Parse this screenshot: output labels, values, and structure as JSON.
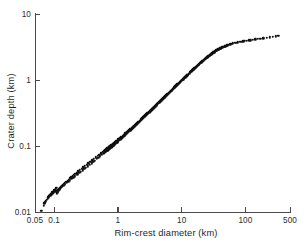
{
  "chart_data": {
    "type": "scatter",
    "title": "",
    "xlabel": "Rim-crest diameter (km)",
    "ylabel": "Crater depth (km)",
    "xscale": "log",
    "yscale": "log",
    "xlim": [
      0.05,
      500
    ],
    "ylim": [
      0.01,
      10
    ],
    "xticks": [
      0.05,
      0.1,
      1,
      10,
      100,
      500
    ],
    "xticklabels": [
      "0.05",
      "0.1",
      "1",
      "10",
      "100",
      "500"
    ],
    "yticks": [
      0.01,
      0.1,
      1,
      10
    ],
    "yticklabels": [
      "0.01",
      "0.1",
      "1",
      "10"
    ],
    "grid": false,
    "legend": null,
    "marker": "filled-circle",
    "marker_color": "#111111",
    "series": [
      {
        "name": "craters",
        "x": [
          0.063,
          0.068,
          0.07,
          0.072,
          0.074,
          0.076,
          0.079,
          0.081,
          0.083,
          0.085,
          0.087,
          0.089,
          0.09,
          0.092,
          0.094,
          0.096,
          0.098,
          0.1,
          0.101,
          0.103,
          0.105,
          0.107,
          0.109,
          0.11,
          0.112,
          0.115,
          0.118,
          0.12,
          0.123,
          0.126,
          0.13,
          0.134,
          0.138,
          0.143,
          0.148,
          0.155,
          0.162,
          0.17,
          0.178,
          0.186,
          0.195,
          0.205,
          0.215,
          0.228,
          0.24,
          0.255,
          0.27,
          0.288,
          0.305,
          0.325,
          0.345,
          0.37,
          0.395,
          0.42,
          0.45,
          0.48,
          0.51,
          0.545,
          0.58,
          0.61,
          0.625,
          0.64,
          0.655,
          0.665,
          0.675,
          0.685,
          0.695,
          0.705,
          0.715,
          0.725,
          0.735,
          0.745,
          0.76,
          0.775,
          0.79,
          0.81,
          0.83,
          0.85,
          0.875,
          0.9,
          0.93,
          0.96,
          0.99,
          1.02,
          1.05,
          1.08,
          1.12,
          1.15,
          1.19,
          1.23,
          1.27,
          1.31,
          1.36,
          1.4,
          1.45,
          1.5,
          1.55,
          1.6,
          1.66,
          1.72,
          1.78,
          1.84,
          1.9,
          1.97,
          2.04,
          2.11,
          2.18,
          2.26,
          2.34,
          2.42,
          2.5,
          2.59,
          2.68,
          2.77,
          2.87,
          2.97,
          3.07,
          3.18,
          3.29,
          3.4,
          3.52,
          3.64,
          3.77,
          3.9,
          4.03,
          4.17,
          4.32,
          4.47,
          4.62,
          4.78,
          4.95,
          5.12,
          5.3,
          5.48,
          5.67,
          5.87,
          6.07,
          6.28,
          6.5,
          6.72,
          6.95,
          7.19,
          7.44,
          7.7,
          7.96,
          8.24,
          8.52,
          8.82,
          9.12,
          9.44,
          9.76,
          10.1,
          10.4,
          10.8,
          11.2,
          11.6,
          12.0,
          12.4,
          12.8,
          13.3,
          13.7,
          14.2,
          14.7,
          15.2,
          15.8,
          16.3,
          16.9,
          17.5,
          18.1,
          18.7,
          19.4,
          20.1,
          20.8,
          21.5,
          22.3,
          23.1,
          23.9,
          24.7,
          25.6,
          26.5,
          27.4,
          28.4,
          29.4,
          30.4,
          31.5,
          32.6,
          33.7,
          34.9,
          36.1,
          37.4,
          38.7,
          40.1,
          41.5,
          43.0,
          44.5,
          46.1,
          47.7,
          49.4,
          51.1,
          52.9,
          55.0,
          58.0,
          61.0,
          64.0,
          68.0,
          72.0,
          76.0,
          81.0,
          86.0,
          92.0,
          98.0,
          105.0,
          112.0,
          120.0,
          130.0,
          142.0,
          155.0,
          170.0,
          190.0,
          215.0,
          240.0,
          270.0,
          300.0,
          330.0,
          0.082,
          0.086,
          0.091,
          0.095,
          0.099,
          0.104,
          0.108,
          0.113,
          0.117,
          0.122,
          0.128,
          0.133,
          0.14,
          0.147,
          0.158,
          0.166,
          0.176,
          0.19,
          0.2,
          0.212,
          0.232,
          0.248,
          0.262,
          0.28,
          0.298,
          0.315,
          0.335,
          0.36,
          0.385,
          0.41,
          0.435,
          0.465,
          0.495,
          0.525,
          0.56,
          0.595,
          0.618,
          0.632,
          0.648,
          0.66,
          0.67,
          0.68,
          0.69,
          0.7,
          0.71,
          0.72,
          0.73,
          0.74,
          0.752,
          0.768,
          0.782,
          0.8,
          0.82,
          0.84,
          0.862,
          0.888,
          0.915,
          0.945,
          0.975,
          1.0,
          1.04,
          1.07,
          1.1,
          1.14,
          1.17,
          1.21,
          1.25,
          1.29,
          1.33,
          1.38,
          1.43,
          1.48,
          1.53,
          1.58,
          1.63,
          1.69,
          1.75,
          1.81,
          1.87,
          1.94,
          2.0,
          2.07,
          2.14,
          2.22,
          2.3,
          2.38,
          2.46,
          2.55,
          2.63,
          2.72,
          2.82,
          2.92,
          3.02,
          3.13,
          3.24,
          3.35,
          3.46,
          3.58,
          3.71,
          3.84,
          3.97,
          4.1,
          4.25,
          4.4,
          4.55,
          4.7,
          4.87,
          5.04,
          5.21,
          5.39,
          5.58,
          5.77,
          5.97,
          6.18,
          6.39,
          6.61,
          6.84,
          7.07,
          7.32,
          7.57,
          7.83,
          8.1,
          8.38,
          8.67,
          8.97,
          9.28,
          9.6,
          9.93,
          10.3,
          10.6,
          11.0,
          11.4,
          11.8,
          12.2,
          12.6,
          13.1,
          13.5,
          14.0,
          14.5,
          15.0,
          15.5,
          16.1,
          16.6,
          17.2,
          17.8,
          18.4,
          19.1,
          19.8,
          20.5,
          21.2,
          22.0,
          22.8,
          23.6,
          24.4,
          25.3,
          26.2,
          27.1,
          28.1,
          29.1,
          30.1,
          31.2,
          32.3,
          33.4,
          34.6,
          35.8,
          37.1,
          38.4,
          39.8,
          41.2,
          42.6,
          44.1,
          45.7,
          47.3,
          49.0,
          50.7,
          52.5
        ],
        "y": [
          0.0105,
          0.0125,
          0.0135,
          0.014,
          0.0145,
          0.0152,
          0.016,
          0.0168,
          0.0175,
          0.0182,
          0.0176,
          0.0182,
          0.0188,
          0.0194,
          0.02,
          0.0196,
          0.0202,
          0.0208,
          0.0212,
          0.0218,
          0.0223,
          0.0228,
          0.0232,
          0.019,
          0.0196,
          0.0205,
          0.0212,
          0.0218,
          0.0224,
          0.0231,
          0.024,
          0.0248,
          0.0256,
          0.0265,
          0.0274,
          0.0285,
          0.0297,
          0.031,
          0.0322,
          0.0335,
          0.0348,
          0.0363,
          0.0378,
          0.0396,
          0.0412,
          0.0432,
          0.0452,
          0.0475,
          0.0498,
          0.0522,
          0.0548,
          0.0578,
          0.0608,
          0.0638,
          0.0672,
          0.0706,
          0.074,
          0.0778,
          0.0816,
          0.0848,
          0.0865,
          0.088,
          0.0896,
          0.0905,
          0.0915,
          0.0925,
          0.0935,
          0.0945,
          0.0955,
          0.0965,
          0.0975,
          0.0985,
          0.1,
          0.1015,
          0.103,
          0.105,
          0.107,
          0.109,
          0.1115,
          0.114,
          0.117,
          0.12,
          0.123,
          0.126,
          0.129,
          0.132,
          0.136,
          0.139,
          0.143,
          0.147,
          0.151,
          0.155,
          0.16,
          0.164,
          0.169,
          0.174,
          0.179,
          0.184,
          0.19,
          0.196,
          0.202,
          0.208,
          0.214,
          0.221,
          0.228,
          0.235,
          0.242,
          0.25,
          0.258,
          0.266,
          0.274,
          0.283,
          0.292,
          0.301,
          0.311,
          0.321,
          0.331,
          0.342,
          0.353,
          0.364,
          0.376,
          0.388,
          0.4,
          0.413,
          0.426,
          0.44,
          0.454,
          0.469,
          0.484,
          0.499,
          0.516,
          0.532,
          0.549,
          0.567,
          0.585,
          0.604,
          0.623,
          0.643,
          0.664,
          0.685,
          0.707,
          0.73,
          0.754,
          0.778,
          0.803,
          0.829,
          0.856,
          0.883,
          0.912,
          0.941,
          0.971,
          1.0,
          1.03,
          1.06,
          1.1,
          1.13,
          1.17,
          1.21,
          1.24,
          1.28,
          1.32,
          1.36,
          1.41,
          1.45,
          1.5,
          1.54,
          1.59,
          1.64,
          1.69,
          1.74,
          1.79,
          1.85,
          1.9,
          1.96,
          2.02,
          2.08,
          2.14,
          2.2,
          2.26,
          2.32,
          2.38,
          2.44,
          2.5,
          2.56,
          2.62,
          2.68,
          2.74,
          2.8,
          2.86,
          2.92,
          2.97,
          3.02,
          3.07,
          3.12,
          3.17,
          3.21,
          3.26,
          3.3,
          3.34,
          3.38,
          3.42,
          3.48,
          3.53,
          3.58,
          3.63,
          3.68,
          3.72,
          3.77,
          3.81,
          3.85,
          3.89,
          3.94,
          3.98,
          4.02,
          4.07,
          4.12,
          4.17,
          4.22,
          4.28,
          4.35,
          4.42,
          4.5,
          4.58,
          4.66,
          0.0172,
          0.0178,
          0.0184,
          0.019,
          0.0196,
          0.0204,
          0.021,
          0.0216,
          0.0222,
          0.0228,
          0.0236,
          0.0244,
          0.0252,
          0.0262,
          0.0276,
          0.0288,
          0.03,
          0.0318,
          0.033,
          0.0346,
          0.0372,
          0.039,
          0.0408,
          0.0428,
          0.045,
          0.047,
          0.0492,
          0.052,
          0.0548,
          0.0574,
          0.0602,
          0.0634,
          0.0666,
          0.0698,
          0.0734,
          0.0772,
          0.08,
          0.0812,
          0.0826,
          0.0838,
          0.0846,
          0.0856,
          0.0865,
          0.0875,
          0.0885,
          0.0893,
          0.0903,
          0.0912,
          0.0925,
          0.094,
          0.0952,
          0.0968,
          0.0988,
          0.1005,
          0.103,
          0.1055,
          0.1085,
          0.1115,
          0.1145,
          0.1175,
          0.121,
          0.124,
          0.127,
          0.131,
          0.134,
          0.138,
          0.142,
          0.146,
          0.15,
          0.155,
          0.159,
          0.164,
          0.169,
          0.174,
          0.179,
          0.185,
          0.191,
          0.197,
          0.203,
          0.21,
          0.216,
          0.223,
          0.23,
          0.238,
          0.245,
          0.253,
          0.261,
          0.27,
          0.278,
          0.287,
          0.296,
          0.306,
          0.316,
          0.326,
          0.337,
          0.347,
          0.358,
          0.37,
          0.382,
          0.394,
          0.407,
          0.419,
          0.434,
          0.448,
          0.462,
          0.477,
          0.493,
          0.509,
          0.525,
          0.542,
          0.56,
          0.578,
          0.597,
          0.617,
          0.637,
          0.658,
          0.68,
          0.702,
          0.725,
          0.748,
          0.773,
          0.798,
          0.824,
          0.851,
          0.879,
          0.908,
          0.938,
          0.969,
          1.0,
          1.03,
          1.07,
          1.1,
          1.14,
          1.17,
          1.21,
          1.25,
          1.29,
          1.33,
          1.38,
          1.42,
          1.46,
          1.51,
          1.56,
          1.6,
          1.65,
          1.7,
          1.76,
          1.81,
          1.86,
          1.92,
          1.98,
          2.04,
          2.1,
          2.16,
          2.22,
          2.28,
          2.34,
          2.4,
          2.46,
          2.52,
          2.58,
          2.64,
          2.7,
          2.76,
          2.82,
          2.88,
          2.93,
          2.98,
          3.03,
          3.08,
          3.13,
          3.17,
          3.22,
          3.26,
          3.3,
          3.34
        ]
      }
    ]
  },
  "axes": {
    "x_title": "Rim-crest diameter (km)",
    "y_title": "Crater depth (km)",
    "x_tick_labels": [
      "0.05",
      "0.1",
      "1",
      "10",
      "100",
      "500"
    ],
    "y_tick_labels": [
      "10",
      "1",
      "0.1",
      "0.01"
    ]
  },
  "style": {
    "point_color": "#111111",
    "axis_color": "#4a4a4a",
    "text_color": "#1f1f1f",
    "background": "#ffffff"
  }
}
